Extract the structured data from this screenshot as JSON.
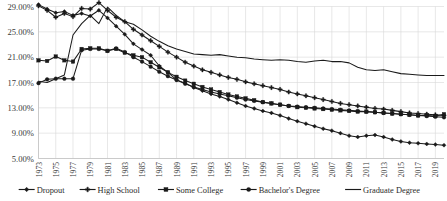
{
  "chart_data": {
    "type": "line",
    "title": "",
    "subtitle": "",
    "xlabel": "",
    "ylabel": "",
    "grid": true,
    "legend_position": "bottom",
    "ylim": [
      5.0,
      29.0
    ],
    "y_tick_labels": [
      "29.00%",
      "25.00%",
      "21.00%",
      "17.00%",
      "13.00%",
      "9.00%",
      "5.00%"
    ],
    "y_tick_values": [
      29.0,
      25.0,
      21.0,
      17.0,
      13.0,
      9.0,
      5.0
    ],
    "x": [
      1973,
      1974,
      1975,
      1976,
      1977,
      1978,
      1979,
      1980,
      1981,
      1982,
      1983,
      1984,
      1985,
      1986,
      1987,
      1988,
      1989,
      1990,
      1991,
      1992,
      1993,
      1994,
      1995,
      1996,
      1997,
      1998,
      1999,
      2000,
      2001,
      2002,
      2003,
      2004,
      2005,
      2006,
      2007,
      2008,
      2009,
      2010,
      2011,
      2012,
      2013,
      2014,
      2015,
      2016,
      2017,
      2018,
      2019,
      2020
    ],
    "x_tick_labels": [
      "1973",
      "1975",
      "1977",
      "1979",
      "1981",
      "1983",
      "1985",
      "1987",
      "1989",
      "1991",
      "1993",
      "1995",
      "1997",
      "1999",
      "2001",
      "2003",
      "2005",
      "2007",
      "2009",
      "2011",
      "2013",
      "2015",
      "2017",
      "2019"
    ],
    "series": [
      {
        "name": "Dropout",
        "marker": "diamond",
        "values": [
          29.3,
          28.6,
          28.0,
          28.2,
          27.6,
          27.9,
          27.5,
          28.4,
          27.2,
          25.9,
          24.6,
          23.1,
          22.2,
          21.3,
          19.6,
          18.6,
          17.4,
          16.9,
          16.2,
          15.7,
          15.2,
          14.8,
          14.3,
          13.8,
          13.3,
          12.9,
          12.5,
          12.2,
          11.8,
          11.3,
          10.9,
          10.5,
          10.1,
          9.7,
          9.4,
          9.0,
          8.6,
          8.4,
          8.6,
          8.7,
          8.4,
          8.0,
          7.7,
          7.5,
          7.4,
          7.3,
          7.2,
          7.1
        ]
      },
      {
        "name": "High School",
        "marker": "plus",
        "values": [
          29.1,
          28.4,
          27.3,
          27.9,
          27.4,
          28.7,
          28.6,
          29.6,
          28.4,
          27.3,
          26.6,
          25.4,
          24.5,
          23.6,
          22.7,
          21.8,
          21.0,
          20.2,
          19.6,
          19.0,
          18.6,
          18.2,
          17.8,
          17.5,
          17.1,
          16.8,
          16.5,
          16.2,
          15.9,
          15.5,
          15.2,
          14.9,
          14.6,
          14.3,
          14.0,
          13.7,
          13.5,
          13.3,
          13.1,
          12.9,
          12.8,
          12.6,
          12.4,
          12.2,
          12.1,
          12.0,
          11.9,
          11.8
        ]
      },
      {
        "name": "Some College",
        "marker": "square",
        "values": [
          20.5,
          20.4,
          21.1,
          20.5,
          20.3,
          22.3,
          22.4,
          22.4,
          22.0,
          22.3,
          21.7,
          21.3,
          21.0,
          20.2,
          19.4,
          18.6,
          17.9,
          17.3,
          16.8,
          16.3,
          15.9,
          15.5,
          15.1,
          14.8,
          14.5,
          14.2,
          13.9,
          13.7,
          13.5,
          13.3,
          13.1,
          13.0,
          12.9,
          12.8,
          12.7,
          12.6,
          12.5,
          12.4,
          12.4,
          12.3,
          12.2,
          12.1,
          12.0,
          11.9,
          11.8,
          11.8,
          11.7,
          12.0
        ]
      },
      {
        "name": "Bachelor's Degree",
        "marker": "circle",
        "values": [
          16.9,
          17.5,
          17.6,
          17.6,
          17.6,
          22.1,
          22.3,
          22.3,
          22.0,
          22.4,
          21.8,
          21.0,
          20.3,
          19.5,
          18.7,
          18.0,
          17.4,
          16.8,
          16.3,
          15.9,
          15.5,
          15.2,
          14.9,
          14.6,
          14.3,
          14.1,
          13.9,
          13.7,
          13.5,
          13.3,
          13.2,
          13.1,
          13.0,
          12.9,
          12.8,
          12.7,
          12.6,
          12.5,
          12.4,
          12.3,
          12.2,
          12.1,
          12.0,
          11.9,
          11.8,
          11.7,
          11.6,
          11.5
        ]
      },
      {
        "name": "Graduate Degree",
        "marker": "none",
        "values": [
          17.2,
          17.0,
          17.6,
          18.2,
          24.5,
          26.3,
          27.6,
          26.3,
          28.9,
          27.6,
          26.6,
          26.2,
          25.3,
          24.3,
          23.5,
          22.8,
          22.3,
          21.9,
          21.5,
          21.4,
          21.3,
          21.4,
          21.2,
          21.0,
          20.9,
          20.7,
          20.6,
          20.5,
          20.6,
          20.5,
          20.3,
          20.2,
          20.4,
          20.5,
          20.3,
          20.3,
          20.1,
          19.4,
          19.0,
          18.9,
          19.0,
          18.7,
          18.4,
          18.3,
          18.2,
          18.1,
          18.1,
          18.1
        ]
      }
    ]
  },
  "legend": {
    "items": [
      {
        "label": "Dropout",
        "marker": "diamond"
      },
      {
        "label": "High School",
        "marker": "plus"
      },
      {
        "label": "Some College",
        "marker": "square"
      },
      {
        "label": "Bachelor's Degree",
        "marker": "circle"
      },
      {
        "label": "Graduate Degree",
        "marker": "none"
      }
    ]
  },
  "colors": {
    "series": "#1a1a1a",
    "grid": "#d9d9d9",
    "axis": "#bdbdbd",
    "text": "#3a3a3a",
    "background": "#ffffff"
  }
}
